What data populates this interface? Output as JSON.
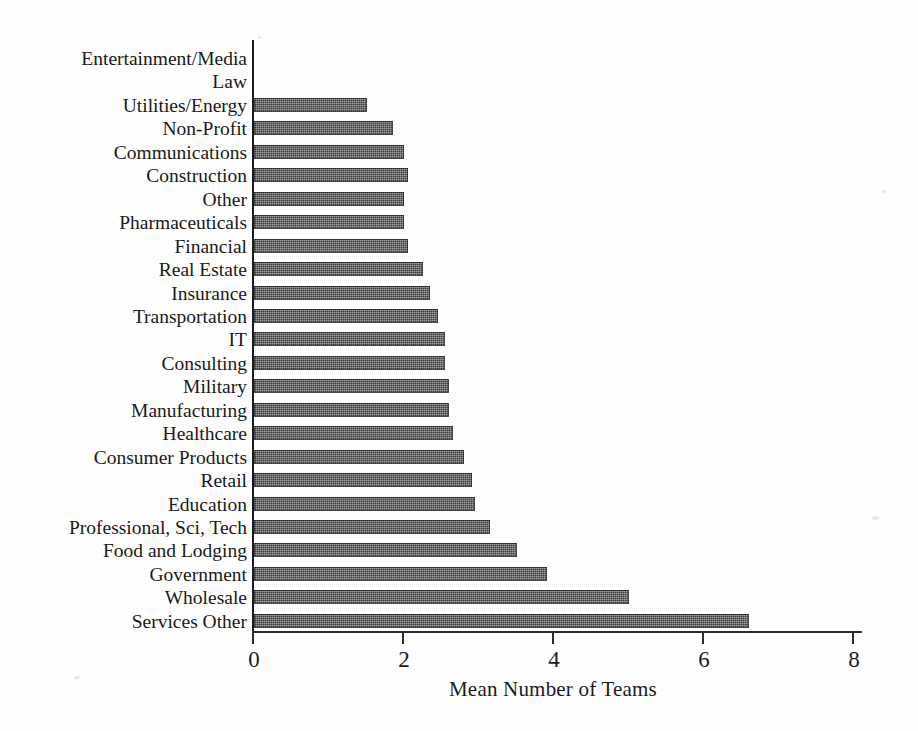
{
  "chart_data": {
    "type": "bar",
    "orientation": "horizontal",
    "title": "",
    "subtitle": "",
    "xlabel": "Mean Number of Teams",
    "ylabel": "",
    "xlim": [
      0,
      8
    ],
    "ylim": null,
    "grid": false,
    "legend": null,
    "legend_position": "none",
    "xticks": [
      0,
      2,
      4,
      6,
      8
    ],
    "xtick_labels": [
      "0",
      "2",
      "4",
      "6",
      "8"
    ],
    "bar_color": "#3b3b3b",
    "background_color": "#ffffff",
    "axis_color": "#1b1b1b",
    "categories": [
      "Entertainment/Media",
      "Law",
      "Utilities/Energy",
      "Non-Profit",
      "Communications",
      "Construction",
      "Other",
      "Pharmaceuticals",
      "Financial",
      "Real Estate",
      "Insurance",
      "Transportation",
      "IT",
      "Consulting",
      "Military",
      "Manufacturing",
      "Healthcare",
      "Consumer Products",
      "Retail",
      "Education",
      "Professional, Sci, Tech",
      "Food and Lodging",
      "Government",
      "Wholesale",
      "Services Other"
    ],
    "values": [
      0,
      0,
      1.5,
      1.85,
      2.0,
      2.05,
      2.0,
      2.0,
      2.05,
      2.25,
      2.35,
      2.45,
      2.55,
      2.55,
      2.6,
      2.6,
      2.65,
      2.8,
      2.9,
      2.95,
      3.15,
      3.5,
      3.9,
      5.0,
      6.6
    ]
  },
  "axis": {
    "x_title": "Mean Number of Teams"
  }
}
